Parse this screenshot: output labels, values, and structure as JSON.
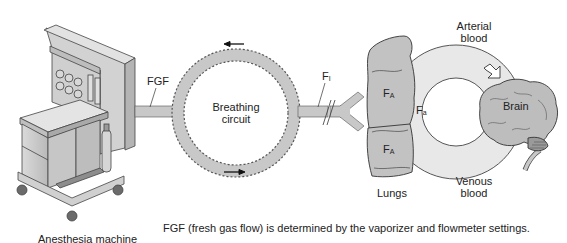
{
  "diagram": {
    "type": "flow-schematic"
  },
  "labels": {
    "anesthesia_machine": "Anesthesia machine",
    "fgf": "FGF",
    "breathing_circuit_line1": "Breathing",
    "breathing_circuit_line2": "circuit",
    "fi_main": "F",
    "fi_sub": "I",
    "fa_upper_main": "F",
    "fa_upper_sub": "A",
    "fa_lower_main": "F",
    "fa_lower_sub": "A",
    "fa_blood_main": "F",
    "fa_blood_sub": "a",
    "lungs": "Lungs",
    "arterial_line1": "Arterial",
    "arterial_line2": "blood",
    "venous_line1": "Venous",
    "venous_line2": "blood",
    "brain": "Brain"
  },
  "caption": "FGF (fresh gas flow) is determined by the vaporizer and flowmeter settings.",
  "colors": {
    "fill_gray": "#c8c8c8",
    "fill_light": "#e6e6e6",
    "stroke": "#444444",
    "background": "#ffffff"
  }
}
